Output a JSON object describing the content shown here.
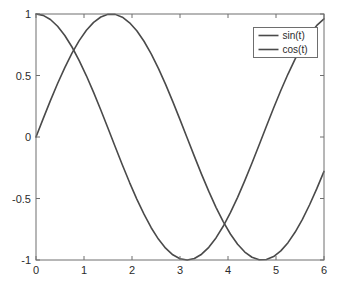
{
  "figure": {
    "background_color": "#ffffff",
    "axes_color": "#6e6e6e",
    "text_color": "#2b2b2b",
    "line_color": "#4a4a4a"
  },
  "chart_data": {
    "type": "line",
    "title": "",
    "xlabel": "",
    "ylabel": "",
    "xlim": [
      0,
      6
    ],
    "ylim": [
      -1,
      1
    ],
    "grid": false,
    "box": true,
    "legend_position": "top-right-inside",
    "xticks": [
      0,
      1,
      2,
      3,
      4,
      5,
      6
    ],
    "xticklabels": [
      "0",
      "1",
      "2",
      "3",
      "4",
      "5",
      "6"
    ],
    "yticks": [
      -1,
      -0.5,
      0,
      0.5,
      1
    ],
    "yticklabels": [
      "-1",
      "-0.5",
      "0",
      "0.5",
      "1"
    ],
    "x": [
      0,
      0.15,
      0.3,
      0.45,
      0.6,
      0.75,
      0.9,
      1.05,
      1.2,
      1.35,
      1.5,
      1.65,
      1.8,
      1.95,
      2.1,
      2.25,
      2.4,
      2.55,
      2.7,
      2.85,
      3,
      3.15,
      3.3,
      3.45,
      3.6,
      3.75,
      3.9,
      4.05,
      4.2,
      4.35,
      4.5,
      4.65,
      4.8,
      4.95,
      5.1,
      5.25,
      5.4,
      5.55,
      5.7,
      5.85,
      6
    ],
    "series": [
      {
        "name": "sin(t)",
        "label": "sin(t)",
        "color": "#4a4a4a",
        "values": [
          0,
          0.1494,
          0.2955,
          0.435,
          0.5646,
          0.6816,
          0.7833,
          0.8674,
          0.932,
          0.9757,
          0.9975,
          0.9969,
          0.9738,
          0.9288,
          0.8632,
          0.7785,
          0.6755,
          0.5577,
          0.4274,
          0.2879,
          0.1411,
          -0.0084,
          -0.1577,
          -0.3035,
          -0.4425,
          -0.5716,
          -0.6878,
          -0.7885,
          -0.8716,
          -0.9354,
          -0.9775,
          -0.9983,
          -0.9962,
          -0.9718,
          -0.9258,
          -0.859,
          -0.7728,
          -0.6692,
          -0.5507,
          -0.4199,
          -0.2794
        ]
      },
      {
        "name": "cos(t)",
        "label": "cos(t)",
        "color": "#4a4a4a",
        "values": [
          1,
          0.9888,
          0.9553,
          0.9004,
          0.8253,
          0.7317,
          0.6216,
          0.4976,
          0.3624,
          0.219,
          0.0707,
          -0.0791,
          -0.2272,
          -0.3704,
          -0.5048,
          -0.6276,
          -0.7374,
          -0.8301,
          -0.9041,
          -0.9577,
          -0.99,
          -1.0,
          -0.9875,
          -0.9528,
          -0.8968,
          -0.8206,
          -0.7259,
          -0.615,
          -0.4903,
          -0.3545,
          -0.2108,
          -0.0624,
          0.0875,
          0.2355,
          0.3781,
          0.5119,
          0.6347,
          0.7431,
          0.8347,
          0.9075,
          0.9602
        ]
      }
    ]
  }
}
